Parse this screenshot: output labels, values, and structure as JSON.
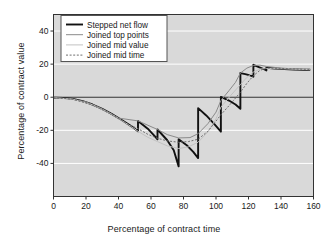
{
  "chart_data": {
    "type": "line",
    "title": "",
    "xlabel": "Percentage of contract time",
    "ylabel": "Percentage of contract value",
    "xlim": [
      0,
      160
    ],
    "ylim": [
      -60,
      50
    ],
    "xticks": [
      0,
      20,
      40,
      60,
      80,
      100,
      120,
      140,
      160
    ],
    "xtick_labels": [
      "0",
      "20",
      "40",
      "60",
      "80",
      "100",
      "120",
      "140",
      "160"
    ],
    "yticks": [
      40,
      20,
      0,
      -20,
      -40
    ],
    "ytick_labels": [
      "40",
      "20",
      "0",
      "-20",
      "-40"
    ],
    "grid": true,
    "grid_axis": "y",
    "legend_position": "upper left",
    "plot_bgcolor": "#d9d9d9",
    "gridline_color": "#ffffff",
    "axis_color": "#333333",
    "series": [
      {
        "name": "Stepped net flow",
        "style": "solid",
        "color": "#111111",
        "width": 1.9,
        "points": [
          [
            0,
            -0.3
          ],
          [
            6,
            -0.4
          ],
          [
            12,
            -1.0
          ],
          [
            18,
            -2.4
          ],
          [
            24,
            -4.4
          ],
          [
            30,
            -7.0
          ],
          [
            36,
            -10.2
          ],
          [
            42,
            -13.8
          ],
          [
            48,
            -17.6
          ],
          [
            52,
            -20.6
          ],
          [
            52,
            -14.3
          ],
          [
            58,
            -19.0
          ],
          [
            62,
            -23.2
          ],
          [
            64,
            -25.4
          ],
          [
            64,
            -19.5
          ],
          [
            70,
            -26.0
          ],
          [
            74,
            -32.0
          ],
          [
            77,
            -41.8
          ],
          [
            77,
            -25.4
          ],
          [
            82,
            -29.0
          ],
          [
            86,
            -33.0
          ],
          [
            89,
            -36.8
          ],
          [
            89,
            -6.6
          ],
          [
            94,
            -11.0
          ],
          [
            99,
            -16.2
          ],
          [
            103,
            -20.8
          ],
          [
            103,
            0.2
          ],
          [
            108,
            -2.0
          ],
          [
            112,
            -4.4
          ],
          [
            115,
            -7.0
          ],
          [
            115,
            14.6
          ],
          [
            118,
            14.0
          ],
          [
            121,
            13.2
          ],
          [
            123,
            12.4
          ],
          [
            123,
            19.6
          ],
          [
            126,
            18.4
          ],
          [
            129,
            17.2
          ],
          [
            131,
            16.2
          ],
          [
            131,
            17.8
          ],
          [
            136,
            17.4
          ],
          [
            142,
            17.0
          ],
          [
            148,
            16.8
          ],
          [
            154,
            16.6
          ],
          [
            158,
            16.6
          ]
        ]
      },
      {
        "name": "Joined top points",
        "style": "solid",
        "color": "#8a8a8a",
        "width": 1.0,
        "points": [
          [
            0,
            -0.3
          ],
          [
            10,
            -0.8
          ],
          [
            20,
            -2.8
          ],
          [
            30,
            -7.0
          ],
          [
            40,
            -12.6
          ],
          [
            52,
            -14.3
          ],
          [
            64,
            -19.5
          ],
          [
            70,
            -22.6
          ],
          [
            77,
            -24.6
          ],
          [
            84,
            -24.4
          ],
          [
            89,
            -22.0
          ],
          [
            95,
            -16.0
          ],
          [
            100,
            -9.0
          ],
          [
            103,
            -2.0
          ],
          [
            108,
            4.0
          ],
          [
            112,
            9.0
          ],
          [
            115,
            14.6
          ],
          [
            119,
            17.6
          ],
          [
            123,
            19.2
          ],
          [
            127,
            19.4
          ],
          [
            131,
            18.6
          ],
          [
            138,
            17.8
          ],
          [
            146,
            17.2
          ],
          [
            154,
            16.8
          ],
          [
            158,
            16.7
          ]
        ]
      },
      {
        "name": "Joined mid value",
        "style": "solid",
        "color": "#c2c2c2",
        "width": 1.0,
        "points": [
          [
            0,
            -0.3
          ],
          [
            12,
            -1.2
          ],
          [
            24,
            -4.6
          ],
          [
            36,
            -10.4
          ],
          [
            48,
            -17.8
          ],
          [
            52,
            -20.6
          ],
          [
            58,
            -24.2
          ],
          [
            64,
            -26.8
          ],
          [
            70,
            -29.4
          ],
          [
            77,
            -31.0
          ],
          [
            83,
            -30.0
          ],
          [
            89,
            -27.2
          ],
          [
            95,
            -21.0
          ],
          [
            100,
            -13.0
          ],
          [
            103,
            -6.0
          ],
          [
            109,
            1.0
          ],
          [
            115,
            7.6
          ],
          [
            119,
            12.0
          ],
          [
            123,
            15.2
          ],
          [
            127,
            17.0
          ],
          [
            131,
            17.4
          ],
          [
            140,
            17.2
          ],
          [
            150,
            16.9
          ],
          [
            158,
            16.7
          ]
        ]
      },
      {
        "name": "Joined mid time",
        "style": "dotted",
        "color": "#6e6e6e",
        "width": 1.0,
        "points": [
          [
            0,
            -0.3
          ],
          [
            12,
            -1.2
          ],
          [
            24,
            -4.6
          ],
          [
            36,
            -10.4
          ],
          [
            46,
            -16.4
          ],
          [
            52,
            -19.0
          ],
          [
            58,
            -22.4
          ],
          [
            64,
            -24.8
          ],
          [
            70,
            -26.4
          ],
          [
            77,
            -27.2
          ],
          [
            83,
            -26.8
          ],
          [
            89,
            -25.4
          ],
          [
            95,
            -20.6
          ],
          [
            100,
            -14.4
          ],
          [
            103,
            -10.6
          ],
          [
            109,
            -4.0
          ],
          [
            115,
            3.0
          ],
          [
            119,
            8.4
          ],
          [
            123,
            13.0
          ],
          [
            127,
            16.2
          ],
          [
            131,
            17.6
          ],
          [
            140,
            17.4
          ],
          [
            150,
            17.0
          ],
          [
            158,
            16.8
          ]
        ]
      }
    ]
  },
  "legend": {
    "entries": [
      {
        "label": "Stepped net flow"
      },
      {
        "label": "Joined top points"
      },
      {
        "label": "Joined mid value"
      },
      {
        "label": "Joined mid time"
      }
    ]
  }
}
